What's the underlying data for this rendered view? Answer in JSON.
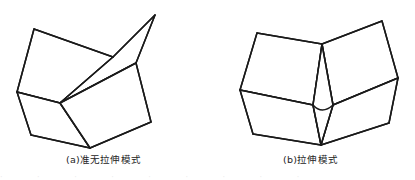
{
  "document": {
    "type": "line-drawing-figure",
    "background_color": "#ffffff",
    "stroke_color": "#1a1a1a",
    "panel_count": 2
  },
  "panels": [
    {
      "id": "a",
      "caption": "(a)准无拉伸模式",
      "label": "(a)",
      "description": "folded quadrilateral mesh, quasi-inextensional mode",
      "face_count": 4
    },
    {
      "id": "b",
      "caption": "(b)拉伸模式",
      "label": "(b)",
      "description": "folded quadrilateral mesh with curved crease, extensional mode",
      "face_count": 5
    }
  ],
  "bleed_text": "· · · · · · · · ·",
  "chart_data": {
    "type": "line",
    "title": "",
    "xlabel": "",
    "ylabel": "",
    "grid": false,
    "legend": "none",
    "series": [
      {
        "name": "panel-a-facet-upper-left",
        "closed": true,
        "points": [
          [
            34,
            29
          ],
          [
            113,
            57
          ],
          [
            60,
            103
          ],
          [
            17,
            92
          ]
        ]
      },
      {
        "name": "panel-a-facet-upper-right",
        "closed": true,
        "points": [
          [
            113,
            57
          ],
          [
            155,
            15
          ],
          [
            136,
            63
          ],
          [
            60,
            103
          ]
        ]
      },
      {
        "name": "panel-a-facet-lower-left",
        "closed": true,
        "points": [
          [
            17,
            92
          ],
          [
            60,
            103
          ],
          [
            90,
            148
          ],
          [
            31,
            135
          ]
        ]
      },
      {
        "name": "panel-a-facet-lower-right",
        "closed": true,
        "points": [
          [
            60,
            103
          ],
          [
            136,
            63
          ],
          [
            151,
            122
          ],
          [
            90,
            148
          ]
        ]
      },
      {
        "name": "panel-b-facet-upper-left",
        "closed": true,
        "points": [
          [
            257,
            33
          ],
          [
            322,
            44
          ],
          [
            313,
            105
          ],
          [
            240,
            90
          ]
        ]
      },
      {
        "name": "panel-b-facet-upper-right",
        "closed": true,
        "points": [
          [
            322,
            44
          ],
          [
            382,
            21
          ],
          [
            398,
            78
          ],
          [
            333,
            105
          ]
        ]
      },
      {
        "name": "panel-b-facet-lower-left",
        "closed": true,
        "points": [
          [
            240,
            90
          ],
          [
            313,
            105
          ],
          [
            321,
            145
          ],
          [
            253,
            134
          ]
        ]
      },
      {
        "name": "panel-b-facet-lower-right",
        "closed": true,
        "points": [
          [
            333,
            105
          ],
          [
            398,
            78
          ],
          [
            389,
            123
          ],
          [
            321,
            145
          ]
        ]
      },
      {
        "name": "panel-b-facet-center-gore",
        "closed": true,
        "points": [
          [
            322,
            44
          ],
          [
            333,
            105
          ],
          [
            321,
            145
          ],
          [
            313,
            105
          ]
        ]
      },
      {
        "name": "panel-b-curved-crease",
        "closed": false,
        "points": [
          [
            313,
            105
          ],
          [
            322,
            110
          ],
          [
            333,
            105
          ]
        ]
      }
    ],
    "xlim": [
      0,
      415
    ],
    "ylim": [
      0,
      180
    ]
  }
}
